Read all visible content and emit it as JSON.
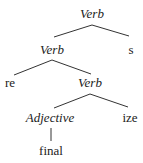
{
  "tree": {
    "nodes": [
      {
        "id": "n0",
        "label": "Verb",
        "italic": true,
        "x": 92,
        "y": 13
      },
      {
        "id": "n1",
        "label": "Verb",
        "italic": true,
        "x": 52,
        "y": 49
      },
      {
        "id": "n2",
        "label": "s",
        "italic": false,
        "x": 131,
        "y": 49
      },
      {
        "id": "n3",
        "label": "re",
        "italic": false,
        "x": 10,
        "y": 82
      },
      {
        "id": "n4",
        "label": "Verb",
        "italic": true,
        "x": 90,
        "y": 82
      },
      {
        "id": "n5",
        "label": "Adjective",
        "italic": true,
        "x": 50,
        "y": 117
      },
      {
        "id": "n6",
        "label": "ize",
        "italic": false,
        "x": 130,
        "y": 117
      },
      {
        "id": "n7",
        "label": "final",
        "italic": false,
        "x": 51,
        "y": 150
      }
    ]
  }
}
